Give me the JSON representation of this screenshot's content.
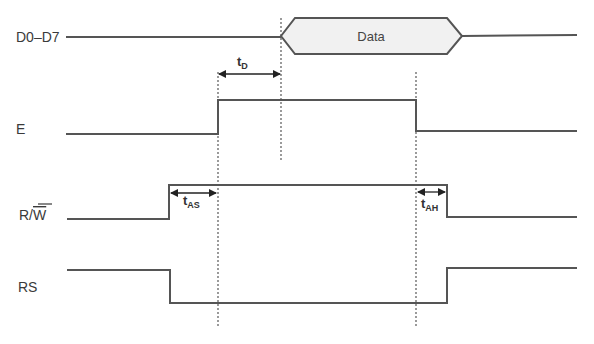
{
  "diagram": {
    "type": "timing-diagram",
    "signals": [
      {
        "name": "D0–D7",
        "label": "D0–D7",
        "kind": "bus",
        "bus_value": "Data"
      },
      {
        "name": "E",
        "label": "E",
        "kind": "digital",
        "sequence": [
          "low",
          "high",
          "low"
        ]
      },
      {
        "name": "R/W",
        "label_main": "R/",
        "label_overbar": "W",
        "kind": "digital",
        "sequence": [
          "low",
          "high",
          "low"
        ]
      },
      {
        "name": "RS",
        "label": "RS",
        "kind": "digital",
        "sequence": [
          "high",
          "low",
          "high"
        ]
      }
    ],
    "timing_parameters": [
      {
        "id": "tD",
        "base": "t",
        "sub": "D"
      },
      {
        "id": "tAS",
        "base": "t",
        "sub": "AS"
      },
      {
        "id": "tAH",
        "base": "t",
        "sub": "AH"
      }
    ],
    "colors": {
      "signal": "#555555",
      "bus_fill": "#f1f1f1",
      "text": "#3a3a3a"
    }
  }
}
